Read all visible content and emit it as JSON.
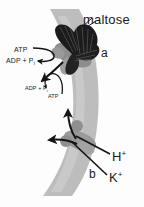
{
  "figure": {
    "colors": {
      "membrane": "#bcbcbc",
      "membrane_inner": "#cfcfcf",
      "protein_dark": "#1c1c1c",
      "protein_gray": "#8f8f8f",
      "protein_gray_light": "#a8a8a8",
      "arrow": "#141414",
      "text": "#1a1a1a",
      "background": "#fdfdfd"
    }
  },
  "labels": {
    "maltose": "maltose",
    "transporter_a": "a",
    "transporter_b": "b",
    "atp_upper": "ATP",
    "adp_upper": "ADP + P",
    "adp_upper_sub": "i",
    "adp_lower": "ADP + P",
    "adp_lower_sub": "i",
    "atp_lower": "ATP",
    "proton": "H",
    "proton_charge": "+",
    "potassium": "K",
    "potassium_charge": "+"
  }
}
